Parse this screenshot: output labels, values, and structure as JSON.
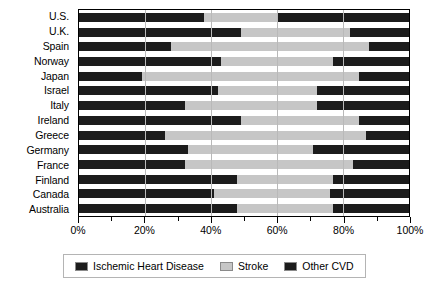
{
  "chart_data": {
    "type": "bar",
    "orientation": "horizontal",
    "stacked": true,
    "normalized": true,
    "title": "",
    "subtitle": "",
    "xlabel": "",
    "ylabel": "",
    "xlim": [
      0,
      100
    ],
    "xunit": "%",
    "grid": true,
    "legend_position": "bottom",
    "categories": [
      "U.S.",
      "U.K.",
      "Spain",
      "Norway",
      "Japan",
      "Israel",
      "Italy",
      "Ireland",
      "Greece",
      "Germany",
      "France",
      "Finland",
      "Canada",
      "Australia"
    ],
    "series": [
      {
        "name": "Ischemic Heart Disease",
        "color": "#1c1c1c",
        "values": [
          38,
          49,
          28,
          43,
          19,
          42,
          32,
          49,
          26,
          33,
          32,
          48,
          41,
          48
        ]
      },
      {
        "name": "Stroke",
        "color": "#c6c6c6",
        "values": [
          22,
          33,
          60,
          34,
          66,
          30,
          40,
          36,
          61,
          38,
          51,
          29,
          35,
          29
        ]
      },
      {
        "name": "Other CVD",
        "color": "#1c1c1c",
        "values": [
          40,
          18,
          12,
          23,
          15,
          28,
          28,
          15,
          13,
          29,
          17,
          23,
          24,
          23
        ]
      }
    ],
    "xticks": [
      0,
      20,
      40,
      60,
      80,
      100
    ],
    "xtick_labels": [
      "0%",
      "20%",
      "40%",
      "60%",
      "80%",
      "100%"
    ],
    "xminor_ticks": [
      10,
      30,
      50,
      70,
      90
    ],
    "gridlines": [
      20,
      40,
      60,
      80
    ],
    "legend": [
      {
        "label": "Ischemic Heart Disease",
        "color": "#1c1c1c"
      },
      {
        "label": "Stroke",
        "color": "#c6c6c6"
      },
      {
        "label": "Other CVD",
        "color": "#1c1c1c"
      }
    ]
  }
}
